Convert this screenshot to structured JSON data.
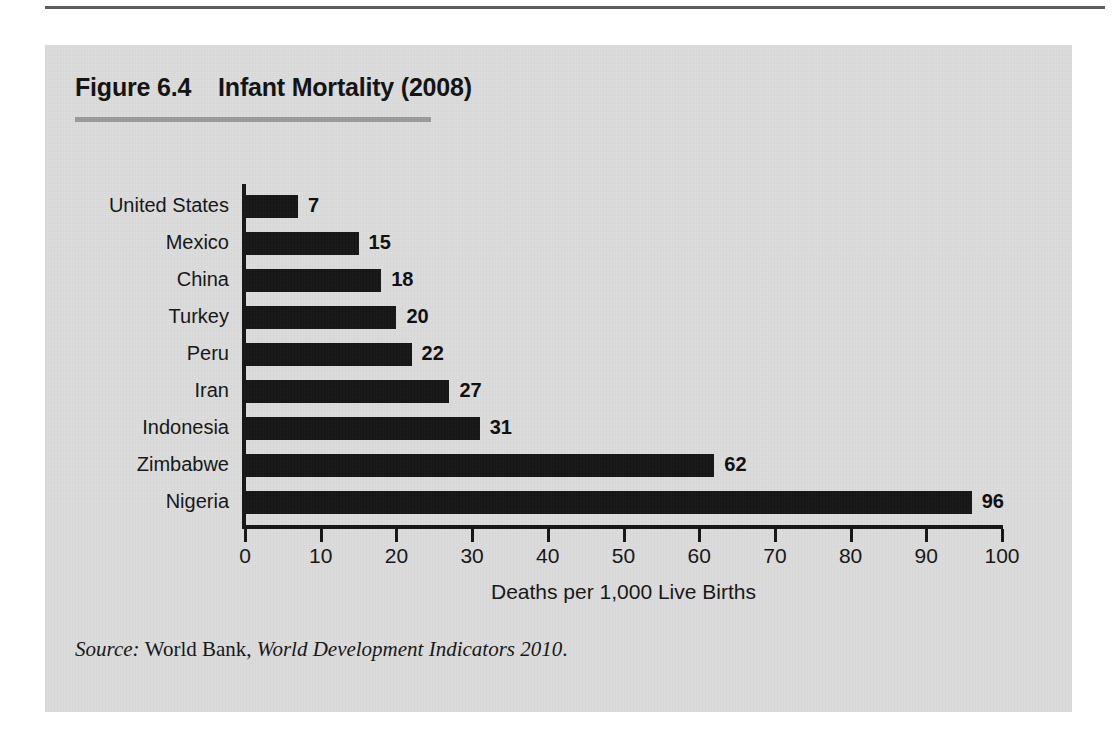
{
  "figure": {
    "label": "Figure 6.4",
    "title": "Infant Mortality (2008)",
    "title_full": "Figure 6.4    Infant Mortality (2008)"
  },
  "source": {
    "lead": "Source:",
    "publisher": "World Bank,",
    "publication": "World Development Indicators 2010",
    "terminator": ".",
    "full": "Source: World Bank, World Development Indicators 2010."
  },
  "colors": {
    "panel_background": "#dcdcdc",
    "page_background": "#ffffff",
    "bar_fill": "#141414",
    "axis": "#141414",
    "title_rule": "#9a9a9a",
    "top_rule": "#5c5c5c",
    "text": "#141414"
  },
  "chart_data": {
    "type": "bar",
    "orientation": "horizontal",
    "title": "Infant Mortality (2008)",
    "xlabel": "Deaths per 1,000 Live Births",
    "ylabel": "",
    "xlim": [
      0,
      100
    ],
    "xticks": [
      0,
      10,
      20,
      30,
      40,
      50,
      60,
      70,
      80,
      90,
      100
    ],
    "xtick_labels": [
      "0",
      "10",
      "20",
      "30",
      "40",
      "50",
      "60",
      "70",
      "80",
      "90",
      "100"
    ],
    "grid": false,
    "legend": null,
    "show_data_labels": true,
    "categories": [
      "United States",
      "Mexico",
      "China",
      "Turkey",
      "Peru",
      "Iran",
      "Indonesia",
      "Zimbabwe",
      "Nigeria"
    ],
    "values": [
      7,
      15,
      18,
      20,
      22,
      27,
      31,
      62,
      96
    ],
    "data_labels": [
      "7",
      "15",
      "18",
      "20",
      "22",
      "27",
      "31",
      "62",
      "96"
    ]
  }
}
